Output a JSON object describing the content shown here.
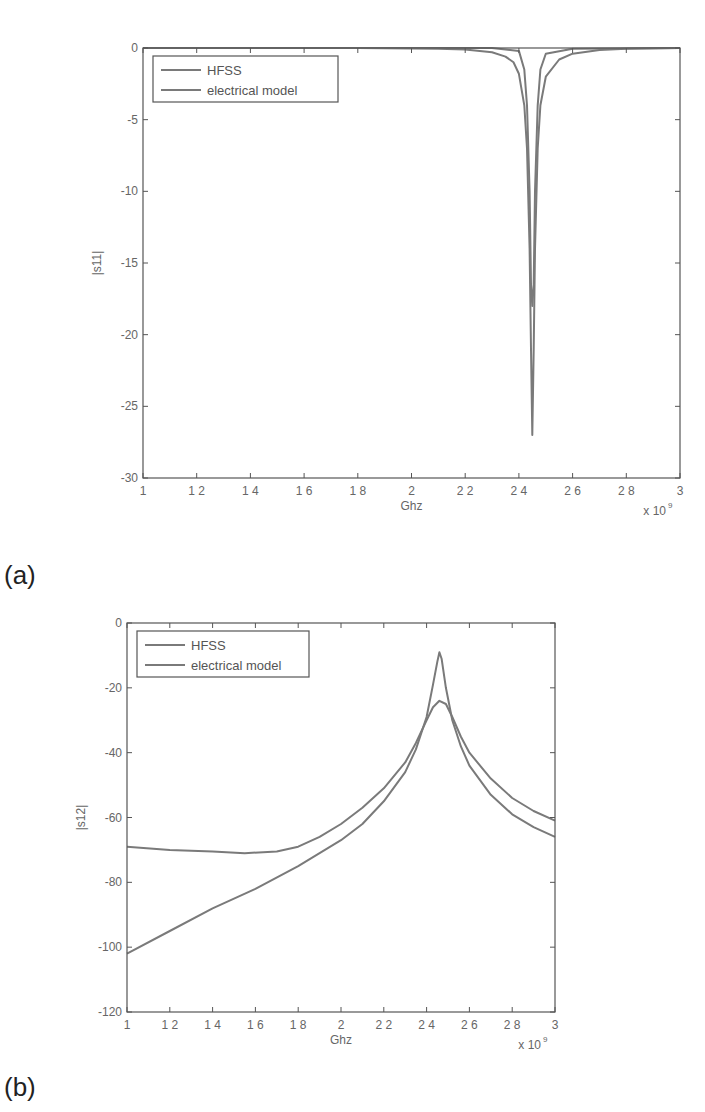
{
  "chart_data": [
    {
      "panel": "(a)",
      "type": "line",
      "title": "",
      "xlabel": "Ghz",
      "ylabel": "|s11|",
      "x_multiplier": "x 10^9",
      "xlim": [
        1,
        3
      ],
      "ylim": [
        -30,
        0
      ],
      "xticks": [
        "1",
        "1.2",
        "1.4",
        "1.6",
        "1.8",
        "2",
        "2.2",
        "2.4",
        "2.6",
        "2.8",
        "3"
      ],
      "yticks": [
        "0",
        "-5",
        "-10",
        "-15",
        "-20",
        "-25",
        "-30"
      ],
      "grid": false,
      "legend_position": "upper left",
      "series": [
        {
          "name": "HFSS",
          "x": [
            1.0,
            1.8,
            2.1,
            2.2,
            2.3,
            2.35,
            2.38,
            2.4,
            2.42,
            2.43,
            2.44,
            2.445,
            2.45,
            2.455,
            2.46,
            2.47,
            2.48,
            2.5,
            2.55,
            2.6,
            2.7,
            2.8,
            3.0
          ],
          "values": [
            0,
            0,
            -0.05,
            -0.1,
            -0.3,
            -0.6,
            -1.0,
            -1.8,
            -4,
            -7,
            -14,
            -21,
            -27,
            -21,
            -14,
            -7,
            -4,
            -2,
            -0.8,
            -0.4,
            -0.15,
            -0.05,
            0
          ]
        },
        {
          "name": "electrical model",
          "x": [
            1.0,
            2.0,
            2.3,
            2.4,
            2.42,
            2.43,
            2.44,
            2.445,
            2.45,
            2.455,
            2.46,
            2.47,
            2.48,
            2.5,
            2.6,
            3.0
          ],
          "values": [
            0,
            0,
            0,
            -0.2,
            -1.5,
            -4,
            -10,
            -16.5,
            -18,
            -16.5,
            -10,
            -4,
            -1.5,
            -0.4,
            -0.05,
            0
          ]
        }
      ]
    },
    {
      "panel": "(b)",
      "type": "line",
      "title": "",
      "xlabel": "Ghz",
      "ylabel": "|s12|",
      "x_multiplier": "x 10^9",
      "xlim": [
        1,
        3
      ],
      "ylim": [
        -120,
        0
      ],
      "xticks": [
        "1",
        "1.2",
        "1.4",
        "1.6",
        "1.8",
        "2",
        "2.2",
        "2.4",
        "2.6",
        "2.8",
        "3"
      ],
      "yticks": [
        "0",
        "-20",
        "-40",
        "-60",
        "-80",
        "-100",
        "-120"
      ],
      "grid": false,
      "legend_position": "upper left",
      "series": [
        {
          "name": "HFSS",
          "x": [
            1.0,
            1.2,
            1.4,
            1.55,
            1.7,
            1.8,
            1.9,
            2.0,
            2.1,
            2.2,
            2.3,
            2.35,
            2.4,
            2.43,
            2.46,
            2.49,
            2.52,
            2.56,
            2.6,
            2.7,
            2.8,
            2.9,
            3.0
          ],
          "values": [
            -69,
            -70,
            -70.5,
            -71,
            -70.5,
            -69,
            -66,
            -62,
            -57,
            -51,
            -43,
            -37,
            -30,
            -26,
            -24,
            -25,
            -29,
            -35,
            -40,
            -48,
            -54,
            -58,
            -61
          ]
        },
        {
          "name": "electrical model",
          "x": [
            1.0,
            1.2,
            1.4,
            1.6,
            1.8,
            2.0,
            2.1,
            2.2,
            2.3,
            2.35,
            2.4,
            2.43,
            2.45,
            2.46,
            2.47,
            2.49,
            2.52,
            2.56,
            2.6,
            2.7,
            2.8,
            2.9,
            3.0
          ],
          "values": [
            -102,
            -95,
            -88,
            -82,
            -75,
            -67,
            -62,
            -55,
            -46,
            -39,
            -29,
            -19,
            -12,
            -9,
            -11,
            -20,
            -30,
            -38,
            -44,
            -53,
            -59,
            -63,
            -66
          ]
        }
      ]
    }
  ],
  "panels": {
    "a": {
      "label": "(a)",
      "ylabel": "|s11|",
      "xlabel": "Ghz",
      "multiplier": "x 10",
      "exponent": "9",
      "legend": [
        "HFSS",
        "electrical model"
      ]
    },
    "b": {
      "label": "(b)",
      "ylabel": "|s12|",
      "xlabel": "Ghz",
      "multiplier": "x 10",
      "exponent": "9",
      "legend": [
        "HFSS",
        "electrical model"
      ]
    }
  },
  "colors": {
    "line": "#7a7a7a",
    "axis": "#555555"
  }
}
